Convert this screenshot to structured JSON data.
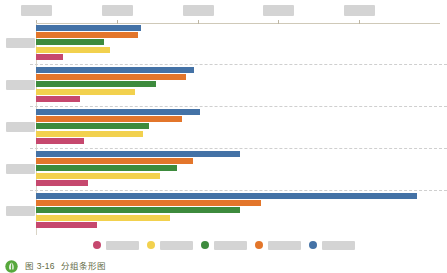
{
  "figure": {
    "caption_number": "图 3-16",
    "caption_title": "分组条形图",
    "caption_icon": "leaf-circle-icon"
  },
  "colors": {
    "blue": "#4472a6",
    "orange": "#e3762b",
    "green": "#3d8b3d",
    "yellow": "#f2d14e",
    "pink": "#c6486e",
    "axis": "#cfc9b8",
    "gridline": "#cfcfcf",
    "redaction": "#d4d4d4",
    "caption_text": "#5f6a45"
  },
  "chart_data": {
    "type": "bar",
    "orientation": "horizontal",
    "grouped": true,
    "title": "分组条形图",
    "xlabel": "",
    "ylabel": "",
    "grid": "dashed-horizontal-separators",
    "legend_position": "bottom",
    "axis_position": "top",
    "xlim": [
      0,
      5
    ],
    "xticks": [
      0,
      1,
      2,
      3,
      4
    ],
    "xticklabels": [
      "████",
      "████",
      "████",
      "████",
      "████"
    ],
    "categories": [
      "███",
      "███",
      "███",
      "███",
      "███"
    ],
    "series": [
      {
        "name": "████",
        "color_key": "pink",
        "values": [
          0.34,
          0.54,
          0.6,
          0.64,
          0.76
        ]
      },
      {
        "name": "████",
        "color_key": "yellow",
        "values": [
          0.91,
          1.22,
          1.32,
          1.54,
          1.66
        ]
      },
      {
        "name": "████",
        "color_key": "green",
        "values": [
          0.84,
          1.49,
          1.4,
          1.74,
          2.53
        ]
      },
      {
        "name": "████",
        "color_key": "orange",
        "values": [
          1.26,
          1.86,
          1.81,
          1.94,
          2.78
        ]
      },
      {
        "name": "████",
        "color_key": "blue",
        "values": [
          1.3,
          1.95,
          2.03,
          2.53,
          4.72
        ]
      }
    ]
  },
  "legend": {
    "items": [
      {
        "label": "████",
        "color_key": "pink"
      },
      {
        "label": "████",
        "color_key": "yellow"
      },
      {
        "label": "████",
        "color_key": "green"
      },
      {
        "label": "████",
        "color_key": "orange"
      },
      {
        "label": "████",
        "color_key": "blue"
      }
    ]
  }
}
